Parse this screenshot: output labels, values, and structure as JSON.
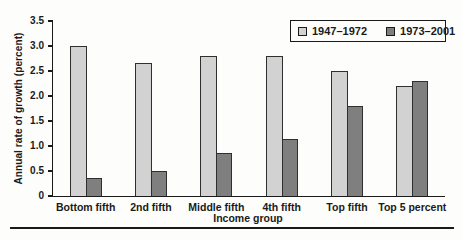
{
  "figure": {
    "background": "#fdfdfc"
  },
  "chart_data": {
    "type": "bar",
    "title": "",
    "xlabel": "Income group",
    "ylabel": "Annual rate of growth (percent)",
    "categories": [
      "Bottom fifth",
      "2nd fifth",
      "Middle fifth",
      "4th fifth",
      "Top fifth",
      "Top 5 percent"
    ],
    "series": [
      {
        "name": "1947–1972",
        "color": "#d2d2d2",
        "values": [
          3.0,
          2.65,
          2.8,
          2.8,
          2.5,
          2.2
        ]
      },
      {
        "name": "1973–2001",
        "color": "#7f7f7f",
        "values": [
          0.35,
          0.5,
          0.85,
          1.15,
          1.8,
          2.3
        ]
      }
    ],
    "ylim": [
      0,
      3.5
    ],
    "yticks": [
      "0",
      "0.5",
      "1.0",
      "1.5",
      "2.0",
      "2.5",
      "3.0",
      "3.5"
    ],
    "grid": false,
    "legend_position": "top-right",
    "px_per_unit": 50
  },
  "colors": {
    "axis": "#1a1a1a",
    "text": "#1a1a1a",
    "bar_border": "#2f2f2f",
    "series_light": "#d2d2d2",
    "series_dark": "#7f7f7f"
  }
}
